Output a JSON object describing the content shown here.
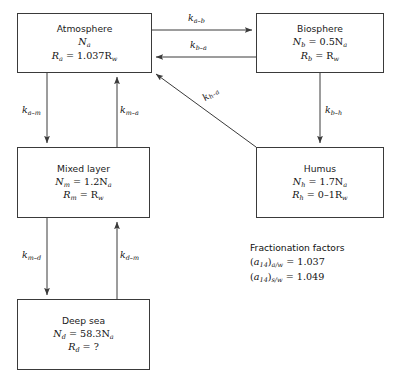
{
  "diagram": {
    "type": "box-and-arrow-flow",
    "boxes": [
      {
        "id": "atmosphere",
        "label": "Atmosphere",
        "line1_prefix": "N",
        "line1_sub": "a",
        "line1_rest": "",
        "line2_prefix": "R",
        "line2_sub": "a",
        "line2_rest": " = 1.037R",
        "line2_rest_sub": "w",
        "x": 17,
        "y": 13,
        "w": 135,
        "h": 60
      },
      {
        "id": "biosphere",
        "label": "Biosphere",
        "line1_prefix": "N",
        "line1_sub": "b",
        "line1_rest": " = 0.5N",
        "line1_rest_sub": "a",
        "line2_prefix": "R",
        "line2_sub": "b",
        "line2_rest": " = R",
        "line2_rest_sub": "w",
        "x": 256,
        "y": 13,
        "w": 128,
        "h": 60
      },
      {
        "id": "mixed-layer",
        "label": "Mixed layer",
        "line1_prefix": "N",
        "line1_sub": "m",
        "line1_rest": " = 1.2N",
        "line1_rest_sub": "a",
        "line2_prefix": "R",
        "line2_sub": "m",
        "line2_rest": " = R",
        "line2_rest_sub": "w",
        "x": 17,
        "y": 147,
        "w": 133,
        "h": 71
      },
      {
        "id": "humus",
        "label": "Humus",
        "line1_prefix": "N",
        "line1_sub": "h",
        "line1_rest": " = 1.7N",
        "line1_rest_sub": "a",
        "line2_prefix": "R",
        "line2_sub": "h",
        "line2_rest": " = 0–1R",
        "line2_rest_sub": "w",
        "x": 256,
        "y": 147,
        "w": 128,
        "h": 71
      },
      {
        "id": "deep-sea",
        "label": "Deep sea",
        "line1_prefix": "N",
        "line1_sub": "d",
        "line1_rest": " = 58.3N",
        "line1_rest_sub": "a",
        "line2_prefix": "R",
        "line2_sub": "d",
        "line2_rest": " = ?",
        "line2_rest_sub": "",
        "x": 17,
        "y": 299,
        "w": 133,
        "h": 71
      }
    ],
    "arrows": [
      {
        "id": "a-b",
        "label_k": "k",
        "label_sub": "a–b",
        "from": "atmosphere",
        "to": "biosphere"
      },
      {
        "id": "b-a",
        "label_k": "k",
        "label_sub": "b–a",
        "from": "biosphere",
        "to": "atmosphere"
      },
      {
        "id": "a-m",
        "label_k": "k",
        "label_sub": "a–m",
        "from": "atmosphere",
        "to": "mixed-layer"
      },
      {
        "id": "m-a",
        "label_k": "k",
        "label_sub": "m–a",
        "from": "mixed-layer",
        "to": "atmosphere"
      },
      {
        "id": "b-h",
        "label_k": "k",
        "label_sub": "b–h",
        "from": "biosphere",
        "to": "humus"
      },
      {
        "id": "h-a",
        "label_k": "k",
        "label_sub": "h–a",
        "from": "humus",
        "to": "atmosphere"
      },
      {
        "id": "m-d",
        "label_k": "k",
        "label_sub": "m–d",
        "from": "mixed-layer",
        "to": "deep-sea"
      },
      {
        "id": "d-m",
        "label_k": "k",
        "label_sub": "d–m",
        "from": "deep-sea",
        "to": "mixed-layer"
      }
    ],
    "fractionation": {
      "heading": "Fractionation factors",
      "rows": [
        {
          "sym": "a",
          "sym_sub": "14",
          "ratio": "a/w",
          "value": " = 1.037"
        },
        {
          "sym": "a",
          "sym_sub": "14",
          "ratio": "s/w",
          "value": " = 1.049"
        }
      ]
    },
    "colors": {
      "stroke": "#3a3a3a",
      "text": "#111111",
      "background": "#ffffff"
    }
  }
}
